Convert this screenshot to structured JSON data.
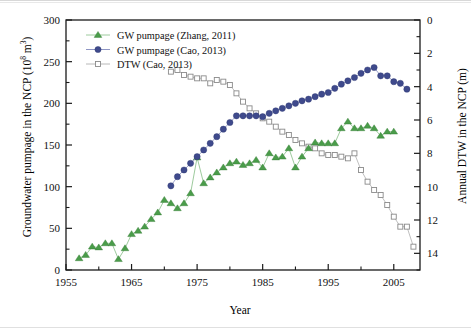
{
  "figure": {
    "xlabel": "Year",
    "ylabel_left_main": "Groundwater pumpage in the NCP (10",
    "ylabel_left_exp": "8",
    "ylabel_left_tail": " m",
    "ylabel_left_exp2": "3",
    "ylabel_left_close": ")",
    "ylabel_right": "Annual DTW in the NCP (m)",
    "colors": {
      "green": "#4a9c4a",
      "green_line": "#9ecb9e",
      "blue": "#3f4a8c",
      "square_edge": "#8a8a8a",
      "axis": "#1a1a1a",
      "background": "#ffffff"
    }
  },
  "chart_data": {
    "type": "line",
    "title": "",
    "xlabel": "Year",
    "ylabel": "Groundwater pumpage in the NCP (10^8 m^3)",
    "ylabel_right": "Annual DTW in the NCP (m)",
    "xlim": [
      1955,
      2009
    ],
    "ylim": [
      0,
      300
    ],
    "ylim_right": [
      0,
      15
    ],
    "right_axis_inverted": true,
    "xticks": [
      1955,
      1965,
      1975,
      1985,
      1995,
      2005
    ],
    "xtick_labels": [
      "1955",
      "1965",
      "1975",
      "1985",
      "1995",
      "2005"
    ],
    "xminor_ticks": [
      1960,
      1970,
      1980,
      1990,
      2000
    ],
    "yticks": [
      0,
      50,
      100,
      150,
      200,
      250,
      300
    ],
    "ytick_labels": [
      "0",
      "50",
      "100",
      "150",
      "200",
      "250",
      "300"
    ],
    "yticks_right": [
      0,
      2,
      4,
      6,
      8,
      10,
      12,
      14
    ],
    "ytick_labels_right": [
      "0",
      "2",
      "4",
      "6",
      "8",
      "10",
      "12",
      "14"
    ],
    "grid": false,
    "legend_position": "upper left",
    "series": [
      {
        "name": "GW pumpage (Zhang, 2011)",
        "axis": "left",
        "marker": "triangle",
        "color": "#4a9c4a",
        "x": [
          1957,
          1958,
          1959,
          1960,
          1961,
          1962,
          1963,
          1964,
          1965,
          1966,
          1967,
          1968,
          1969,
          1970,
          1971,
          1972,
          1973,
          1974,
          1975,
          1976,
          1977,
          1978,
          1979,
          1980,
          1981,
          1982,
          1983,
          1984,
          1985,
          1986,
          1987,
          1988,
          1989,
          1990,
          1991,
          1992,
          1993,
          1994,
          1995,
          1996,
          1997,
          1998,
          1999,
          2000,
          2001,
          2002,
          2003,
          2004,
          2005
        ],
        "values": [
          14,
          18,
          28,
          27,
          32,
          32,
          13,
          26,
          43,
          47,
          52,
          61,
          69,
          84,
          80,
          74,
          80,
          92,
          135,
          104,
          111,
          117,
          123,
          128,
          130,
          126,
          128,
          132,
          123,
          140,
          135,
          136,
          146,
          123,
          136,
          146,
          153,
          152,
          152,
          152,
          170,
          178,
          170,
          170,
          173,
          170,
          161,
          166,
          166
        ]
      },
      {
        "name": "GW pumpage (Cao, 2013)",
        "axis": "left",
        "marker": "circle",
        "color": "#3f4a8c",
        "x": [
          1971,
          1972,
          1973,
          1974,
          1975,
          1976,
          1977,
          1978,
          1979,
          1980,
          1981,
          1982,
          1983,
          1984,
          1985,
          1986,
          1987,
          1988,
          1989,
          1990,
          1991,
          1992,
          1993,
          1994,
          1995,
          1996,
          1997,
          1998,
          1999,
          2000,
          2001,
          2002,
          2003,
          2004,
          2005,
          2006,
          2007
        ],
        "values": [
          101,
          112,
          120,
          128,
          136,
          144,
          152,
          160,
          169,
          177,
          185,
          185,
          185,
          185,
          184,
          188,
          191,
          194,
          197,
          200,
          203,
          205,
          208,
          211,
          213,
          218,
          223,
          227,
          231,
          236,
          240,
          243,
          233,
          233,
          226,
          224,
          217
        ]
      },
      {
        "name": "DTW (Cao, 2013)",
        "axis": "right",
        "marker": "square-open",
        "color": "#8a8a8a",
        "x": [
          1971,
          1972,
          1973,
          1974,
          1975,
          1976,
          1977,
          1978,
          1979,
          1980,
          1981,
          1982,
          1983,
          1984,
          1985,
          1986,
          1987,
          1988,
          1989,
          1990,
          1991,
          1992,
          1993,
          1994,
          1995,
          1996,
          1997,
          1998,
          1999,
          2000,
          2001,
          2002,
          2003,
          2004,
          2005,
          2006,
          2007
        ],
        "values": [
          3.1,
          3.0,
          3.3,
          3.4,
          3.5,
          3.5,
          3.8,
          3.6,
          3.7,
          3.9,
          4.4,
          4.9,
          5.3,
          5.6,
          5.9,
          6.1,
          6.4,
          6.7,
          6.9,
          7.2,
          7.4,
          7.6,
          7.7,
          8.0,
          8.1,
          8.1,
          8.2,
          8.3,
          8.0,
          9.0,
          9.7,
          10.2,
          10.5,
          11.1,
          11.8,
          12.4,
          12.4
        ]
      }
    ],
    "dtw_tail": {
      "x": [
        2002,
        2003,
        2004,
        2005,
        2006,
        2007,
        2008
      ],
      "values": [
        12.3,
        12.3,
        12.3,
        12.5,
        13.0,
        13.3,
        13.6
      ]
    }
  },
  "legend": {
    "entries": [
      {
        "label": "GW pumpage (Zhang, 2011)",
        "marker": "triangle",
        "color": "#4a9c4a"
      },
      {
        "label": "GW pumpage (Cao, 2013)",
        "marker": "circle",
        "color": "#3f4a8c"
      },
      {
        "label": "DTW (Cao, 2013)",
        "marker": "square-open",
        "color": "#8a8a8a"
      }
    ]
  }
}
